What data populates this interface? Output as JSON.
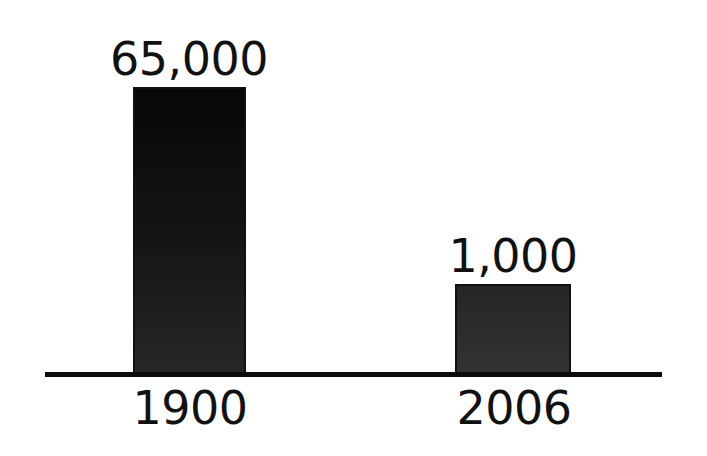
{
  "chart_data": {
    "type": "bar",
    "title": "",
    "xlabel": "",
    "ylabel": "",
    "categories": [
      "1900",
      "2006"
    ],
    "values": [
      65000,
      1000
    ],
    "data_labels": [
      "65,000",
      "1,000"
    ],
    "grid": false,
    "legend": null,
    "note": "Bars not drawn to scale; no y-axis ticks shown",
    "colors": {
      "bar": "#111111",
      "axis": "#0d0d0d",
      "background": "#ffffff"
    }
  },
  "labels": {
    "bar_1_value": "65,000",
    "bar_2_value": "1,000",
    "category_1": "1900",
    "category_2": "2006"
  }
}
